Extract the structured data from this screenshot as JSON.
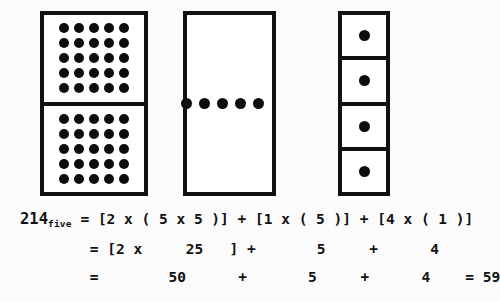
{
  "figure": {
    "background_color": "#fbfbfb",
    "ink_color": "#111111",
    "dot_color": "#0d0d0d"
  },
  "blocks": [
    {
      "name": "hundreds-block",
      "meaning": "2 x ( 5 x 5 )",
      "panel_count": 2,
      "dots_per_panel": 25,
      "grid_rows": 5,
      "grid_cols": 5,
      "total_dots": 50
    },
    {
      "name": "fives-block",
      "meaning": "1 x ( 5 )",
      "panel_count": 1,
      "dots_per_panel": 5,
      "grid_rows": 1,
      "grid_cols": 5,
      "total_dots": 5
    },
    {
      "name": "ones-block",
      "meaning": "4 x ( 1 )",
      "panel_count": 4,
      "dots_per_panel": 1,
      "grid_rows": 1,
      "grid_cols": 1,
      "total_dots": 4
    }
  ],
  "equation": {
    "numeral": "214",
    "base_subscript": "five",
    "line1_rest": " = [2 x ( 5 x 5 )] + [1 x ( 5 )] + [4 x ( 1 )]",
    "line2": "        = [2 x     25   ] +       5     +      4",
    "line3": "        =        50      +       5     +      4    = 59",
    "result": "59"
  }
}
